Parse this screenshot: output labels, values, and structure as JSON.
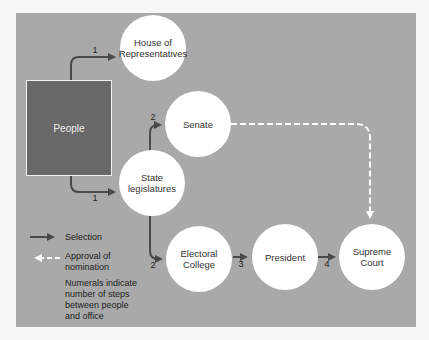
{
  "diagram": {
    "source_box": {
      "label": "People"
    },
    "nodes": [
      {
        "id": "house",
        "label_lines": [
          "House of",
          "Representatives"
        ]
      },
      {
        "id": "senate",
        "label_lines": [
          "Senate"
        ]
      },
      {
        "id": "state",
        "label_lines": [
          "State",
          "legislatures"
        ]
      },
      {
        "id": "electoral",
        "label_lines": [
          "Electoral",
          "College"
        ]
      },
      {
        "id": "president",
        "label_lines": [
          "President"
        ]
      },
      {
        "id": "court",
        "label_lines": [
          "Supreme",
          "Court"
        ]
      }
    ],
    "edges": [
      {
        "from": "People",
        "to": "House of Representatives",
        "type": "selection",
        "step": "1"
      },
      {
        "from": "People",
        "to": "State legislatures",
        "type": "selection",
        "step": "1"
      },
      {
        "from": "State legislatures",
        "to": "Senate",
        "type": "selection",
        "step": "2"
      },
      {
        "from": "State legislatures",
        "to": "Electoral College",
        "type": "selection",
        "step": "2"
      },
      {
        "from": "Electoral College",
        "to": "President",
        "type": "selection",
        "step": "3"
      },
      {
        "from": "President",
        "to": "Supreme Court",
        "type": "selection",
        "step": "4"
      },
      {
        "from": "Senate",
        "to": "Supreme Court",
        "type": "approval",
        "step": ""
      }
    ],
    "step_labels": {
      "house": "1",
      "state": "1",
      "senate": "2",
      "electoral": "2",
      "president": "3",
      "court": "4"
    }
  },
  "legend": {
    "selection": "Selection",
    "approval_line1": "Approval of",
    "approval_line2": "nomination",
    "note_lines": [
      "Numerals indicate",
      "number of steps",
      "between people",
      "and office"
    ]
  },
  "colors": {
    "panel": "#a9a9a9",
    "people_box": "#696969",
    "arrow": "#4a4a4a",
    "circle": "#ffffff",
    "dashed": "#ffffff"
  }
}
